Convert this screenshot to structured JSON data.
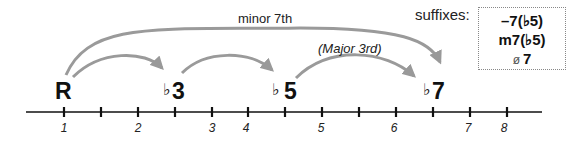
{
  "diagram": {
    "notes": [
      {
        "label": "R",
        "flat": "",
        "degree": "",
        "x": 64
      },
      {
        "label": "3",
        "flat": "♭",
        "degree": "b3",
        "x": 175
      },
      {
        "label": "5",
        "flat": "♭",
        "degree": "b5",
        "x": 285
      },
      {
        "label": "7",
        "flat": "♭",
        "degree": "b7",
        "x": 433
      }
    ],
    "arc_labels": {
      "minor_seventh": "minor  7th",
      "major_third": "(Major  3rd)"
    },
    "axis": {
      "tick_numbers": [
        "1",
        "2",
        "3",
        "4",
        "5",
        "6",
        "7",
        "8"
      ]
    },
    "suffixes": {
      "title": "suffixes:",
      "items": [
        "–7(♭5)",
        "m7(♭5)",
        "7"
      ],
      "half_dim_symbol": "ø"
    },
    "colors": {
      "arc": "#999999",
      "line": "#111111",
      "text": "#111111"
    }
  }
}
